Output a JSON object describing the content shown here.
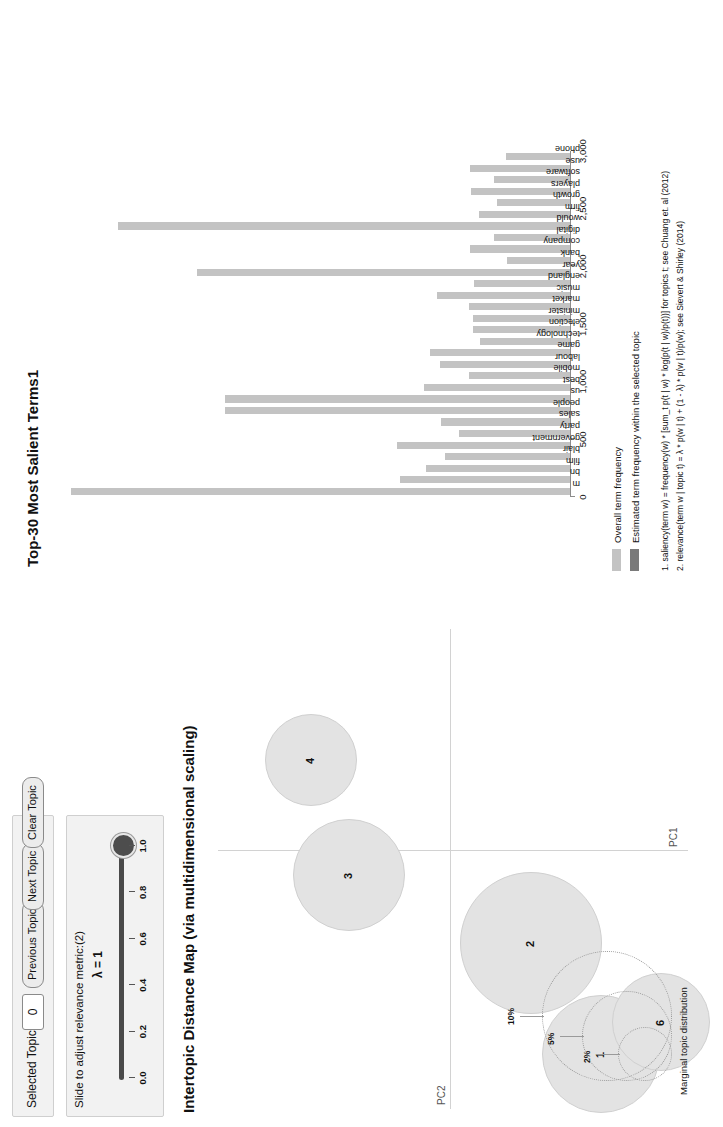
{
  "controls": {
    "selected_topic_label": "Selected Topic:",
    "selected_topic_value": "0",
    "previous_topic": "Previous Topic",
    "next_topic": "Next Topic",
    "clear_topic": "Clear Topic",
    "slider_label": "Slide to adjust relevance metric:(2)",
    "lambda_label": "λ = 1",
    "slider_ticks": [
      "0.0",
      "0.2",
      "0.4",
      "0.6",
      "0.8",
      "1.0"
    ],
    "slider_value": 1.0
  },
  "map": {
    "title": "Intertopic Distance Map (via multidimensional scaling)",
    "xaxis_label": "PC1",
    "yaxis_label": "PC2",
    "marginal_title": "Marginal topic distribution",
    "marginal_ticks": [
      "2%",
      "5%",
      "10%"
    ],
    "topics": [
      {
        "id": "1",
        "cx": 64,
        "cy": 400,
        "r": 58
      },
      {
        "id": "2",
        "cx": 175,
        "cy": 330,
        "r": 70
      },
      {
        "id": "3",
        "cx": 243,
        "cy": 148,
        "r": 55
      },
      {
        "id": "4",
        "cx": 358,
        "cy": 110,
        "r": 45
      },
      {
        "id": "6",
        "cx": 96,
        "cy": 460,
        "r": 48
      }
    ]
  },
  "chart_data": {
    "type": "bar",
    "title": "Top-30 Most Salient Terms1",
    "xlabel": "",
    "ylabel": "",
    "ylim": [
      0,
      3000
    ],
    "ticks": [
      "0",
      "500",
      "1,000",
      "1,500",
      "2,000",
      "2,500",
      "3,000"
    ],
    "categories": [
      "m",
      "bn",
      "film",
      "blair",
      "government",
      "party",
      "sales",
      "people",
      "us",
      "best",
      "mobile",
      "labour",
      "game",
      "technology",
      "election",
      "minister",
      "market",
      "music",
      "england",
      "year",
      "bank",
      "company",
      "digital",
      "would",
      "firm",
      "growth",
      "players",
      "software",
      "use",
      "phone"
    ],
    "values": [
      2880,
      980,
      830,
      720,
      1000,
      640,
      745,
      1990,
      1990,
      840,
      585,
      750,
      810,
      520,
      560,
      560,
      580,
      770,
      555,
      2150,
      365,
      575,
      440,
      2610,
      525,
      420,
      570,
      440,
      575,
      370
    ],
    "series": [
      {
        "name": "Overall term frequency",
        "color": "#c3c3c3"
      },
      {
        "name": "Estimated term frequency within the selected topic",
        "color": "#7a7a7a"
      }
    ]
  },
  "legend": {
    "overall": "Overall term frequency",
    "estimated": "Estimated term frequency within the selected topic",
    "footnote1": "1. saliency(term w) = frequency(w) * [sum_t p(t | w) * log(p(t | w)/p(t))] for topics t; see Chuang et. al (2012)",
    "footnote2": "2. relevance(term w | topic t) = λ * p(w | t) + (1 - λ) * p(w | t)/p(w); see Sievert & Shirley (2014)"
  }
}
